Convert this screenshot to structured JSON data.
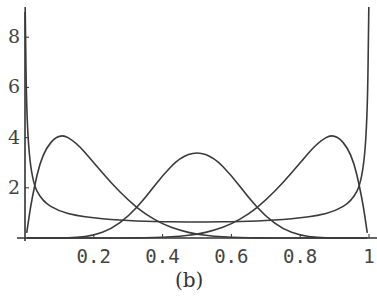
{
  "chart_data": {
    "type": "line",
    "title": "",
    "caption": "(b)",
    "xlabel": "",
    "ylabel": "",
    "xlim": [
      0,
      1
    ],
    "ylim": [
      0,
      9
    ],
    "grid": false,
    "legend": null,
    "x_ticks": [
      "0.2",
      "0.4",
      "0.6",
      "0.8",
      "1"
    ],
    "y_ticks": [
      "2",
      "4",
      "6",
      "8"
    ],
    "x": [
      0.005,
      0.02,
      0.05,
      0.1,
      0.15,
      0.2,
      0.25,
      0.3,
      0.35,
      0.4,
      0.45,
      0.5,
      0.55,
      0.6,
      0.65,
      0.7,
      0.75,
      0.8,
      0.85,
      0.9,
      0.95,
      0.98,
      0.995
    ],
    "series": [
      {
        "name": "U-shaped (arcsine-like)",
        "values": [
          4.5,
          2.27,
          1.46,
          1.06,
          0.89,
          0.8,
          0.74,
          0.69,
          0.67,
          0.65,
          0.64,
          0.64,
          0.64,
          0.65,
          0.67,
          0.69,
          0.74,
          0.8,
          0.89,
          1.06,
          1.46,
          2.27,
          4.5
        ]
      },
      {
        "name": "left peak",
        "values": [
          0.2,
          1.6,
          3.4,
          4.2,
          3.8,
          3.0,
          2.2,
          1.5,
          0.95,
          0.55,
          0.3,
          0.15,
          0.07,
          0.03,
          0.01,
          0.0,
          0.0,
          0.0,
          0.0,
          0.0,
          0.0,
          0.0,
          0.0
        ]
      },
      {
        "name": "center peak",
        "values": [
          0.0,
          0.0,
          0.0,
          0.0,
          0.02,
          0.1,
          0.35,
          0.85,
          1.6,
          2.5,
          3.2,
          3.45,
          3.2,
          2.5,
          1.6,
          0.85,
          0.35,
          0.1,
          0.02,
          0.0,
          0.0,
          0.0,
          0.0
        ]
      },
      {
        "name": "right peak",
        "values": [
          0.0,
          0.0,
          0.0,
          0.0,
          0.0,
          0.0,
          0.0,
          0.0,
          0.01,
          0.03,
          0.07,
          0.15,
          0.3,
          0.55,
          0.95,
          1.5,
          2.2,
          3.0,
          3.8,
          4.2,
          3.4,
          1.6,
          0.2
        ]
      }
    ]
  }
}
